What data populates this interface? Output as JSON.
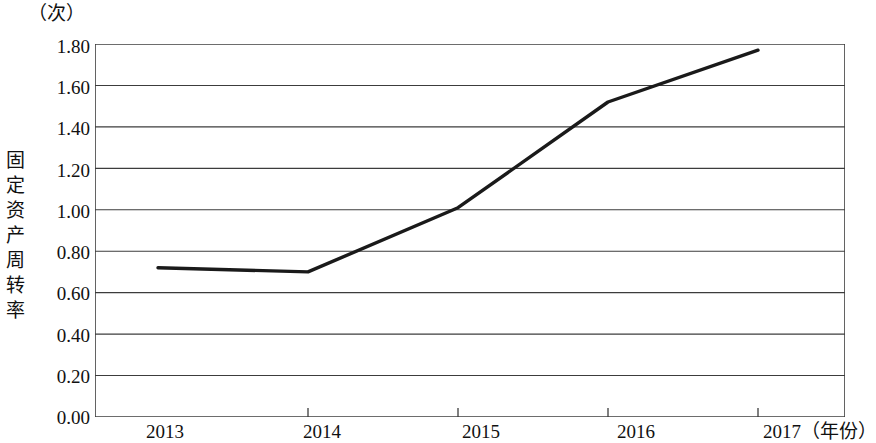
{
  "chart_data": {
    "type": "line",
    "title": "",
    "subtitle": "",
    "unit_label": "（次）",
    "ylabel": "固定资产周转率",
    "xlabel": "（年份）",
    "categories": [
      "2013",
      "2014",
      "2015",
      "2016",
      "2017"
    ],
    "values": [
      0.72,
      0.7,
      1.01,
      1.52,
      1.77
    ],
    "series": [
      {
        "name": "固定资产周转率",
        "values": [
          0.72,
          0.7,
          1.01,
          1.52,
          1.77
        ]
      }
    ],
    "ylim": [
      0.0,
      1.8
    ],
    "ytick_labels": [
      "1.80",
      "1.60",
      "1.40",
      "1.20",
      "1.00",
      "0.80",
      "0.60",
      "0.40",
      "0.20",
      "0.00"
    ],
    "ytick_values": [
      1.8,
      1.6,
      1.4,
      1.2,
      1.0,
      0.8,
      0.6,
      0.4,
      0.2,
      0.0
    ],
    "xtick_labels": [
      "2013",
      "2014",
      "2015",
      "2016",
      "2017"
    ],
    "grid": "horizontal",
    "legend": "none",
    "line_color": "#1a1a1a",
    "grid_color": "#3c3c3c",
    "background_color": "#ffffff",
    "annotations": []
  },
  "axis": {
    "x_tick_2013": "2013",
    "x_tick_2014": "2014",
    "x_tick_2015": "2015",
    "x_tick_2016": "2016",
    "x_tick_2017": "2017（年份）"
  }
}
